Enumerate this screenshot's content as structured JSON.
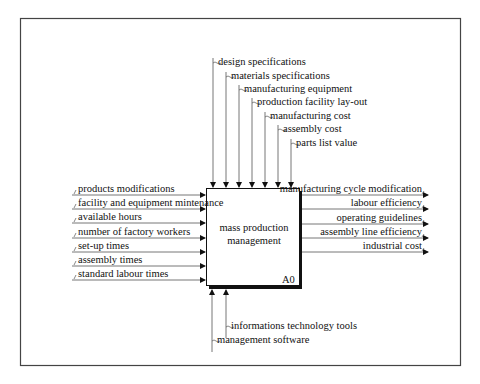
{
  "diagram": {
    "type": "IDEF0 activity diagram",
    "activity": {
      "title_line1": "mass production",
      "title_line2": "management",
      "node_id": "A0"
    },
    "controls": [
      {
        "label": "design specifications"
      },
      {
        "label": "materials specifications"
      },
      {
        "label": "manufacturing equipment"
      },
      {
        "label": "production facility lay-out"
      },
      {
        "label": "manufacturing cost"
      },
      {
        "label": "assembly cost"
      },
      {
        "label": "parts list value"
      }
    ],
    "inputs": [
      {
        "label": "products modifications"
      },
      {
        "label": "facility and equipment mintenance"
      },
      {
        "label": "available hours"
      },
      {
        "label": "number of factory workers"
      },
      {
        "label": "set-up times"
      },
      {
        "label": "assembly times"
      },
      {
        "label": "standard labour times"
      }
    ],
    "outputs": [
      {
        "label": "manufacturing cycle modification"
      },
      {
        "label": "labour efficiency"
      },
      {
        "label": "operating guidelines"
      },
      {
        "label": "assembly line efficiency"
      },
      {
        "label": "industrial cost"
      }
    ],
    "mechanisms": [
      {
        "label": "informations technology tools"
      },
      {
        "label": "management software"
      }
    ],
    "colors": {
      "line": "#555555",
      "arrowhead": "#111111",
      "box_border": "#111111",
      "frame": "#444444",
      "background": "#ffffff"
    }
  }
}
